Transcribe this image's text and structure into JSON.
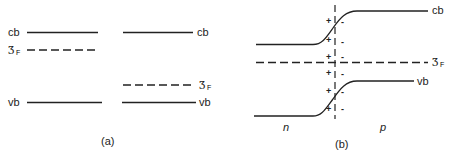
{
  "panel_a": {
    "caption": "(a)",
    "left": {
      "cb_label": "cb",
      "fermi_label": "Ʒ",
      "fermi_sub": "F",
      "vb_label": "vb"
    },
    "right": {
      "cb_label": "cb",
      "fermi_label": "Ʒ",
      "fermi_sub": "F",
      "vb_label": "vb"
    }
  },
  "panel_b": {
    "caption": "(b)",
    "cb_label": "cb",
    "vb_label": "vb",
    "fermi_label": "Ʒ",
    "fermi_sub": "F",
    "n_label": "n",
    "p_label": "p",
    "plus_sign": "+",
    "minus_sign": "-"
  },
  "colors": {
    "line": "#222222",
    "background": "#ffffff"
  }
}
